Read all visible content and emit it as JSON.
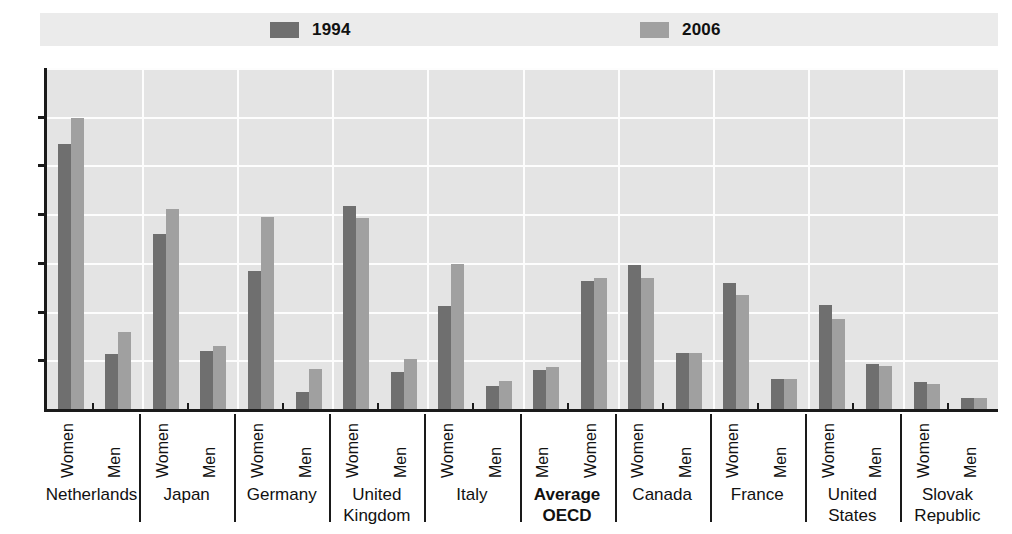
{
  "legend": {
    "entries": [
      {
        "label": "1994",
        "color": "#6f6f6f"
      },
      {
        "label": "2006",
        "color": "#a0a0a0"
      }
    ]
  },
  "axis": {
    "y_ticks": [
      "0",
      "10",
      "20",
      "30",
      "40",
      "50",
      "60",
      "70"
    ]
  },
  "chart_data": {
    "type": "bar",
    "title": "",
    "subtitle": "",
    "xlabel": "",
    "ylabel": "",
    "ylim": [
      0,
      70
    ],
    "ytick_step": 10,
    "grid": true,
    "legend_position": "top",
    "series": [
      {
        "name": "1994",
        "color": "#6f6f6f"
      },
      {
        "name": "2006",
        "color": "#a0a0a0"
      }
    ],
    "groups": [
      {
        "country": "Netherlands",
        "bold": false,
        "subgroups": [
          {
            "label": "Women",
            "values": [
              54.5,
              59.8
            ]
          },
          {
            "label": "Men",
            "values": [
              11.3,
              15.9
            ]
          }
        ]
      },
      {
        "country": "Japan",
        "bold": false,
        "subgroups": [
          {
            "label": "Women",
            "values": [
              36.0,
              41.0
            ]
          },
          {
            "label": "Men",
            "values": [
              12.0,
              13.0
            ]
          }
        ]
      },
      {
        "country": "Germany",
        "bold": false,
        "subgroups": [
          {
            "label": "Women",
            "values": [
              28.3,
              39.5
            ]
          },
          {
            "label": "Men",
            "values": [
              3.5,
              8.2
            ]
          }
        ]
      },
      {
        "country": "United\nKingdom",
        "bold": false,
        "subgroups": [
          {
            "label": "Women",
            "values": [
              41.6,
              39.2
            ]
          },
          {
            "label": "Men",
            "values": [
              7.5,
              10.3
            ]
          }
        ]
      },
      {
        "country": "Italy",
        "bold": false,
        "subgroups": [
          {
            "label": "Women",
            "values": [
              21.2,
              29.8
            ]
          },
          {
            "label": "Men",
            "values": [
              4.8,
              5.8
            ]
          }
        ]
      },
      {
        "country": "Average\nOECD",
        "bold": true,
        "subgroups": [
          {
            "label": "Men",
            "values": [
              8.0,
              8.7
            ]
          },
          {
            "label": "Women",
            "values": [
              26.2,
              26.9
            ]
          }
        ]
      },
      {
        "country": "Canada",
        "bold": false,
        "subgroups": [
          {
            "label": "Women",
            "values": [
              29.5,
              26.8
            ]
          },
          {
            "label": "Men",
            "values": [
              11.6,
              11.5
            ]
          }
        ]
      },
      {
        "country": "France",
        "bold": false,
        "subgroups": [
          {
            "label": "Women",
            "values": [
              25.8,
              23.5
            ]
          },
          {
            "label": "Men",
            "values": [
              6.2,
              6.1
            ]
          }
        ]
      },
      {
        "country": "United\nStates",
        "bold": false,
        "subgroups": [
          {
            "label": "Women",
            "values": [
              21.3,
              18.5
            ]
          },
          {
            "label": "Men",
            "values": [
              9.3,
              8.8
            ]
          }
        ]
      },
      {
        "country": "Slovak\nRepublic",
        "bold": false,
        "subgroups": [
          {
            "label": "Women",
            "values": [
              5.5,
              5.2
            ]
          },
          {
            "label": "Men",
            "values": [
              2.2,
              2.2
            ]
          }
        ]
      }
    ]
  }
}
